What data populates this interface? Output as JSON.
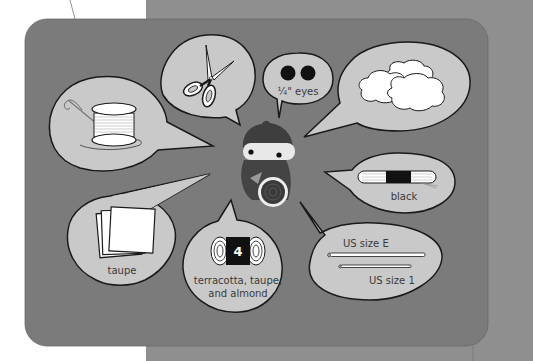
{
  "colors": {
    "page_bg": "#ffffff",
    "back_block": "#8f8f8f",
    "panel": "#7b7b7b",
    "bubble_fill": "#c9c9c9",
    "bubble_stroke": "#1a1a1a",
    "label_text": "#3a3a3a"
  },
  "center": {
    "figure": "crocheted amigurumi doll with round shield"
  },
  "bubbles": [
    {
      "id": "thread",
      "icon": "thread-spool-needle-icon",
      "label": ""
    },
    {
      "id": "scissors",
      "icon": "scissors-icon",
      "label": ""
    },
    {
      "id": "eyes",
      "icon": "safety-eyes-icon",
      "label": "¼\" eyes"
    },
    {
      "id": "stuffing",
      "icon": "fiberfill-cloud-icon",
      "label": ""
    },
    {
      "id": "floss",
      "icon": "embroidery-floss-icon",
      "label": "black"
    },
    {
      "id": "felt",
      "icon": "felt-sheets-icon",
      "label": "taupe"
    },
    {
      "id": "yarn",
      "icon": "yarn-weight-icon",
      "badge": "4",
      "label_line1": "terracotta, taupe,",
      "label_line2": "and almond"
    },
    {
      "id": "hooks",
      "icon": "crochet-hooks-icon",
      "label_top": "US size E",
      "label_bottom": "US size 1"
    }
  ]
}
